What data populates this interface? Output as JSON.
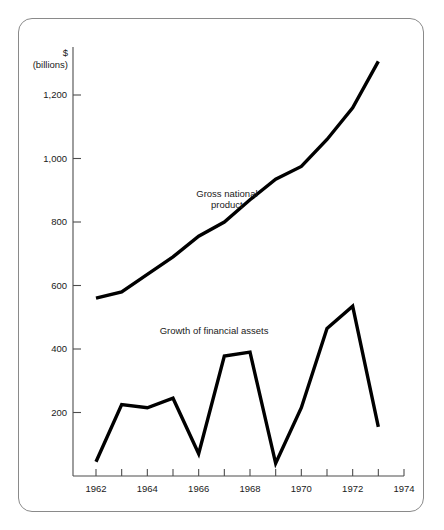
{
  "figure": {
    "frame": {
      "border_color": "#8a8a8a",
      "background": "#ffffff"
    },
    "ink_color": "#000000",
    "axis_color": "#4d4d4d"
  },
  "axis_title": {
    "line1": "$",
    "line2": "(billions)"
  },
  "chart_data": {
    "type": "line",
    "title": "",
    "subtitle": "",
    "xlabel": "",
    "ylabel": "$ (billions)",
    "grid": false,
    "legend_position": "inline-annotation",
    "xlim": [
      1961,
      1974
    ],
    "ylim": [
      0,
      1320
    ],
    "x_tick_values": [
      1962,
      1963,
      1964,
      1965,
      1966,
      1967,
      1968,
      1969,
      1970,
      1971,
      1972,
      1973,
      1974
    ],
    "x_tick_labels": [
      "1962",
      "",
      "1964",
      "",
      "1966",
      "",
      "1968",
      "",
      "1970",
      "",
      "1972",
      "",
      "1974"
    ],
    "y_tick_values": [
      200,
      400,
      600,
      800,
      1000,
      1200
    ],
    "y_tick_labels": [
      "200",
      "400",
      "600",
      "800",
      "1,000",
      "1,200"
    ],
    "x": [
      1962,
      1963,
      1964,
      1965,
      1966,
      1967,
      1968,
      1969,
      1970,
      1971,
      1972,
      1973
    ],
    "series": [
      {
        "name": "Gross national product",
        "label_line1": "Gross national",
        "label_line2": "product",
        "label_x": 1967.1,
        "label_y": 880,
        "color": "#000000",
        "values": [
          560,
          580,
          635,
          690,
          755,
          800,
          870,
          935,
          975,
          1060,
          1160,
          1306
        ]
      },
      {
        "name": "Growth of financial assets",
        "label_line1": "Growth of financial assets",
        "label_line2": "",
        "label_x": 1966.6,
        "label_y": 448,
        "color": "#000000",
        "values": [
          45,
          225,
          215,
          245,
          70,
          378,
          390,
          40,
          215,
          465,
          535,
          155
        ]
      }
    ]
  }
}
